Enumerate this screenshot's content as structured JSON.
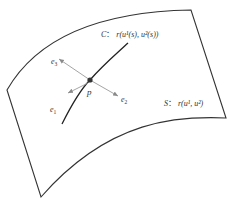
{
  "diagram": {
    "type": "surface-curve-frame",
    "colors": {
      "edge": "#333333",
      "curve": "#222222",
      "arrow": "#9a9a9a",
      "point": "#333333",
      "text": "#333333"
    },
    "curve_label": {
      "name": "C",
      "sep": "：",
      "expr": "r(u¹(s), u²(s))"
    },
    "surface_label": {
      "name": "S",
      "sep": "：",
      "expr": "r(u¹, u²)"
    },
    "point_label": "p",
    "vectors": [
      {
        "name": "e",
        "sub": "1"
      },
      {
        "name": "e",
        "sub": "2"
      },
      {
        "name": "e",
        "sub": "3"
      }
    ]
  }
}
